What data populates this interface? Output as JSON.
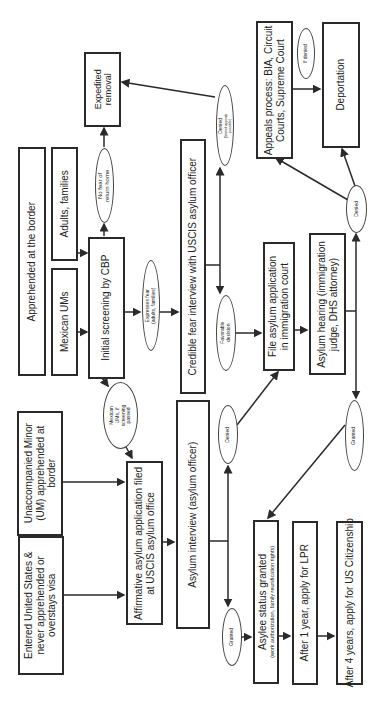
{
  "diagram": {
    "orientation": "rotated 90 degrees counter-clockwise",
    "nodes": {
      "expedited_removal": "Expedited removal",
      "apprehended_border": "Apprehended at the border",
      "adults_families": "Adults, families",
      "mexican_ums": "Mexican UMs",
      "initial_screening": "Initial screening by CBP",
      "credible_fear": "Credible fear interview with USCIS asylum officer",
      "appeals_process_line1": "Appeals process: BIA, Circuit",
      "appeals_process_line2": "Courts, Supreme Court",
      "deportation": "Deportation",
      "file_asylum_line1": "File asylum application",
      "file_asylum_line2": "in immigration court",
      "asylum_hearing_line1": "Asylum hearing (immigration",
      "asylum_hearing_line2": "judge, DHS attorney)",
      "unaccompanied_line1": "Unaccompanied Minor",
      "unaccompanied_line2": "(UM) apprehended at",
      "unaccompanied_line3": "border",
      "entered_us_line1": "Entered United States &",
      "entered_us_line2": "never apprehended or",
      "entered_us_line3": "overstays visa",
      "affirmative_line1": "Affirmative asylum application filed",
      "affirmative_line2": "at USCIS asylum office",
      "asylum_interview": "Asylum interview (asylum officer)",
      "asylee_status": "Asylee status granted",
      "asylee_status_sub": "(work authorization, family reunification rights)",
      "after_1_year": "After 1 year, apply for LPR",
      "after_4_years": "After 4 years, apply for US Citizenship"
    },
    "decisions": {
      "no_fear_line1": "No fear of",
      "no_fear_line2": "return home",
      "expresses_fear_line1": "Expresses fear",
      "expresses_fear_line2": "(adults, families)",
      "mexican_ums_passed_line1": "Mexican",
      "mexican_ums_passed_line2": "UMs, if",
      "mexican_ums_passed_line3": "screening",
      "mexican_ums_passed_line4": "passed",
      "denied_limited": "Denied",
      "denied_limited_sub_line1": "(limited appeals",
      "denied_limited_sub_line2": "possible)",
      "favorable_line1": "Favorable",
      "favorable_line2": "decision",
      "if_denied": "If denied",
      "denied_hearing": "Denied",
      "granted_hearing": "Granted",
      "denied_interview": "Denied",
      "granted_interview": "Granted"
    },
    "colors": {
      "stroke": "#2a2a2a",
      "background": "#ffffff",
      "text": "#222222"
    }
  }
}
